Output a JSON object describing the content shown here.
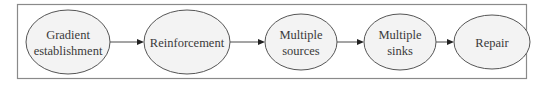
{
  "diagram": {
    "type": "flow",
    "direction": "left-to-right",
    "colors": {
      "frame_stroke": "#8a8a8a",
      "node_fill": "#f3f3f3",
      "node_stroke": "#555555",
      "text": "#3a3a3a",
      "arrow": "#222222"
    },
    "nodes": [
      {
        "id": "gradient",
        "shape": "ellipse",
        "lines": [
          "Gradient",
          "establishment"
        ]
      },
      {
        "id": "reinforcement",
        "shape": "ellipse",
        "lines": [
          "Reinforcement"
        ]
      },
      {
        "id": "sources",
        "shape": "ellipse",
        "lines": [
          "Multiple",
          "sources"
        ]
      },
      {
        "id": "sinks",
        "shape": "ellipse",
        "lines": [
          "Multiple",
          "sinks"
        ]
      },
      {
        "id": "repair",
        "shape": "ellipse",
        "lines": [
          "Repair"
        ]
      }
    ],
    "edges": [
      {
        "from": "gradient",
        "to": "reinforcement"
      },
      {
        "from": "reinforcement",
        "to": "sources"
      },
      {
        "from": "sources",
        "to": "sinks"
      },
      {
        "from": "sinks",
        "to": "repair"
      }
    ]
  }
}
